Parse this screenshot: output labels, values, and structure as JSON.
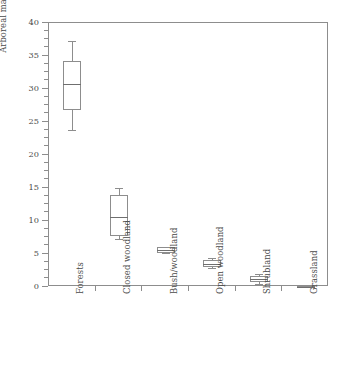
{
  "chart_data": {
    "type": "box",
    "title": "",
    "xlabel": "",
    "ylabel": "Arboreal mammals (%)",
    "ylim": [
      0,
      40
    ],
    "ytick_values": [
      0,
      5,
      10,
      15,
      20,
      25,
      30,
      35,
      40
    ],
    "ytick_labels": [
      "0",
      "5",
      "10",
      "15",
      "20",
      "25",
      "30",
      "35",
      "40"
    ],
    "y_minor_tick_step": 1.25,
    "grid": false,
    "legend": "none",
    "categories": [
      "Forests",
      "Closed woodland",
      "Bush/woodland",
      "Open woodland",
      "Shrubland",
      "Grassland"
    ],
    "boxes": [
      {
        "category": "Forests",
        "whisker_low": 23.8,
        "q1": 26.8,
        "median": 30.8,
        "q3": 34.3,
        "whisker_high": 37.3
      },
      {
        "category": "Closed woodland",
        "whisker_low": 7.3,
        "q1": 7.7,
        "median": 10.6,
        "q3": 14.0,
        "whisker_high": 15.0
      },
      {
        "category": "Bush/woodland",
        "whisker_low": 5.1,
        "q1": 5.2,
        "median": 5.6,
        "q3": 6.0,
        "whisker_high": 6.1
      },
      {
        "category": "Open woodland",
        "whisker_low": 2.9,
        "q1": 3.1,
        "median": 3.5,
        "q3": 4.1,
        "whisker_high": 4.4
      },
      {
        "category": "Shrubland",
        "whisker_low": 0.4,
        "q1": 0.7,
        "median": 1.2,
        "q3": 1.7,
        "whisker_high": 2.0
      },
      {
        "category": "Grassland",
        "whisker_low": 0.0,
        "q1": 0.0,
        "median": 0.05,
        "q3": 0.1,
        "whisker_high": 0.1
      }
    ],
    "colors": {
      "line": "#8d8d8d",
      "median": "#6f6f6f",
      "text": "#4a4a4a",
      "background": "#ffffff"
    }
  }
}
